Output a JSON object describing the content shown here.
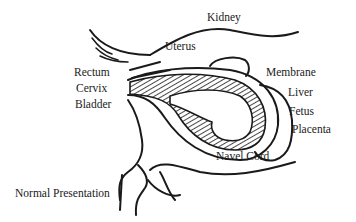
{
  "diagram": {
    "caption": "Normal Presentation",
    "labels": {
      "kidney": "Kidney",
      "uterus": "Uterus",
      "rectum": "Rectum",
      "cervix": "Cervix",
      "bladder": "Bladder",
      "membrane": "Membrane",
      "liver": "Liver",
      "fetus": "Fetus",
      "placenta": "Placenta",
      "navel_cord": "Navel Cord"
    },
    "colors": {
      "ink": "#1a1a1a",
      "background": "#ffffff"
    }
  }
}
